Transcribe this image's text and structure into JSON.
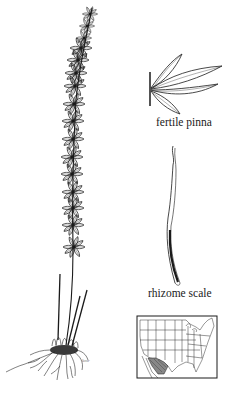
{
  "illustration": {
    "subject": "fern habit drawing with whorled pinnae",
    "labels": {
      "fertile_pinna": "fertile pinna",
      "rhizome_scale": "rhizome scale",
      "artist_signature": "kmr"
    },
    "range_map": {
      "region": "United States (contiguous) with southwest shaded range",
      "shaded_area": "southwestern border region (Arizona / New Mexico / Texas area)"
    },
    "colors": {
      "ink": "#1a1a1a",
      "background": "#ffffff",
      "map_shade": "#888888"
    }
  }
}
